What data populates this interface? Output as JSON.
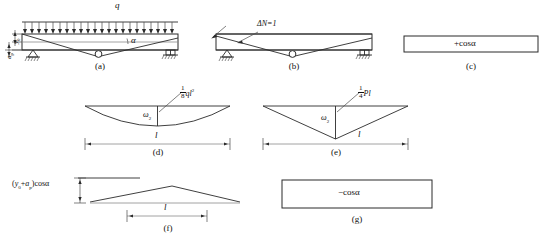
{
  "figure": {
    "title_domain": "structural-beam-diagrams",
    "captions": {
      "a": "(a)",
      "b": "(b)",
      "c": "(c)",
      "d": "(d)",
      "e": "(e)",
      "f": "(f)",
      "g": "(g)"
    }
  },
  "panel_a": {
    "load_label": "q",
    "angle_label": "α",
    "left_dim_upper": "y",
    "left_dim_upper_sub": "0",
    "left_dim_lower": "a",
    "left_dim_lower_sub": "p",
    "support_left": "pin-support",
    "support_right": "roller-support",
    "hinge": "mid-span-hinge"
  },
  "panel_b": {
    "force_label": "ΔN=1",
    "support_left": "pin-support",
    "support_right": "roller-support",
    "hinge": "mid-span-hinge"
  },
  "panel_c": {
    "value_label": "+cosα"
  },
  "panel_d": {
    "peak_num": "1",
    "peak_den": "8",
    "peak_expr": "ql",
    "peak_sup": "2",
    "area_label": "ω",
    "area_sub": "2",
    "span_label": "l",
    "shape": "parabola"
  },
  "panel_e": {
    "peak_num": "1",
    "peak_den": "4",
    "peak_expr": "Pl",
    "area_label": "ω",
    "area_sub": "2",
    "span_label": "l",
    "shape": "triangle"
  },
  "panel_f": {
    "height_label_open": "(",
    "height_y": "y",
    "height_y_sub": "0",
    "height_plus": "+",
    "height_a": "a",
    "height_a_sub": "p",
    "height_label_close": ")cosα",
    "span_label": "l",
    "shape": "triangle"
  },
  "panel_g": {
    "value_label": "−cosα"
  },
  "colors": {
    "line": "#2a2a2a",
    "thin_line": "#4a4a4a",
    "gray_line": "#8a8a8a",
    "text": "#111111",
    "background": "#ffffff"
  }
}
